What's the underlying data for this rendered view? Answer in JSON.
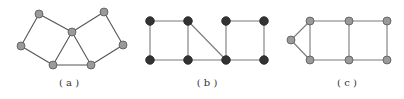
{
  "colors": {
    "background": "#ffffff",
    "gray_node_fill": "#9a9a9a",
    "gray_node_stroke": "#555555",
    "black_node_fill": "#333333",
    "black_node_stroke": "#222222",
    "edge_a": "#555555",
    "edge_bc": "#7a7a7a",
    "label": "#333333"
  },
  "graphs": [
    {
      "id": "a",
      "label": "( a )",
      "label_pos": [
        69,
        86
      ],
      "node_style": "gray",
      "nodes": [
        {
          "id": "a1",
          "x": 39,
          "y": 14
        },
        {
          "id": "a2",
          "x": 21,
          "y": 46
        },
        {
          "id": "a3",
          "x": 72,
          "y": 32
        },
        {
          "id": "a4",
          "x": 53,
          "y": 65
        },
        {
          "id": "a5",
          "x": 91,
          "y": 65
        },
        {
          "id": "a6",
          "x": 104,
          "y": 12
        },
        {
          "id": "a7",
          "x": 123,
          "y": 45
        }
      ],
      "edges": [
        [
          "a1",
          "a2"
        ],
        [
          "a1",
          "a3"
        ],
        [
          "a2",
          "a4"
        ],
        [
          "a3",
          "a4"
        ],
        [
          "a3",
          "a5"
        ],
        [
          "a4",
          "a5"
        ],
        [
          "a3",
          "a6"
        ],
        [
          "a6",
          "a7"
        ],
        [
          "a7",
          "a5"
        ]
      ]
    },
    {
      "id": "b",
      "label": "( b )",
      "label_pos": [
        207,
        86
      ],
      "node_style": "black",
      "nodes": [
        {
          "id": "b1",
          "x": 150,
          "y": 21
        },
        {
          "id": "b2",
          "x": 188,
          "y": 21
        },
        {
          "id": "b3",
          "x": 226,
          "y": 21
        },
        {
          "id": "b4",
          "x": 264,
          "y": 21
        },
        {
          "id": "b5",
          "x": 150,
          "y": 60
        },
        {
          "id": "b6",
          "x": 188,
          "y": 60
        },
        {
          "id": "b7",
          "x": 226,
          "y": 60
        },
        {
          "id": "b8",
          "x": 264,
          "y": 60
        }
      ],
      "edges": [
        [
          "b1",
          "b2"
        ],
        [
          "b3",
          "b4"
        ],
        [
          "b5",
          "b6"
        ],
        [
          "b6",
          "b7"
        ],
        [
          "b7",
          "b8"
        ],
        [
          "b1",
          "b5"
        ],
        [
          "b2",
          "b6"
        ],
        [
          "b3",
          "b7"
        ],
        [
          "b4",
          "b8"
        ],
        [
          "b2",
          "b7"
        ]
      ]
    },
    {
      "id": "c",
      "label": "( c )",
      "label_pos": [
        347,
        86
      ],
      "node_style": "gray",
      "nodes": [
        {
          "id": "c0",
          "x": 291,
          "y": 40
        },
        {
          "id": "c1",
          "x": 310,
          "y": 21
        },
        {
          "id": "c2",
          "x": 349,
          "y": 21
        },
        {
          "id": "c3",
          "x": 387,
          "y": 21
        },
        {
          "id": "c4",
          "x": 310,
          "y": 60
        },
        {
          "id": "c5",
          "x": 349,
          "y": 60
        },
        {
          "id": "c6",
          "x": 387,
          "y": 60
        }
      ],
      "edges": [
        [
          "c0",
          "c1"
        ],
        [
          "c0",
          "c4"
        ],
        [
          "c1",
          "c2"
        ],
        [
          "c2",
          "c3"
        ],
        [
          "c4",
          "c5"
        ],
        [
          "c5",
          "c6"
        ],
        [
          "c1",
          "c4"
        ],
        [
          "c2",
          "c5"
        ],
        [
          "c3",
          "c6"
        ]
      ]
    }
  ]
}
